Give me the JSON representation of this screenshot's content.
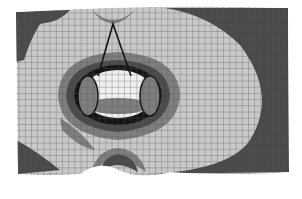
{
  "figure": {
    "type": "fea-mesh-contour",
    "width": 302,
    "height": 199,
    "background": "#ffffff",
    "colors": {
      "dark": "#4a4a4a",
      "mid": "#7e7e7e",
      "light": "#c8c8c8",
      "bright": "#efefef",
      "ring": "#151515",
      "mesh_line": "#555555"
    },
    "mesh": {
      "outline": "M16,12 Q150,4 288,8 L289,172 Q240,176 170,172 Q140,180 118,170 Q100,160 80,174 Q50,176 18,174 Z",
      "cell_size": 6.2
    },
    "regions": [
      {
        "name": "dark-right-region",
        "fill": "dark",
        "d": "M165,8 L288,8 L289,172 L150,174 Q230,170 250,140 Q278,95 240,45 Q210,15 165,8 Z"
      },
      {
        "name": "dark-top-left-patch",
        "fill": "dark",
        "d": "M16,12 L70,10 Q60,22 40,24 Q30,40 24,60 L16,62 Z"
      },
      {
        "name": "dark-bottom-left-patch",
        "fill": "dark",
        "d": "M16,140 Q35,150 60,170 L18,174 Z"
      },
      {
        "name": "mid-top-notch",
        "fill": "mid",
        "d": "M92,10 Q113,30 135,10 Q125,22 113,24 Q100,22 92,10 Z"
      },
      {
        "name": "mid-halo",
        "fill": "mid",
        "d": "M58,95 Q60,55 118,52 Q178,55 180,95 Q178,135 118,140 Q60,135 58,95 Z"
      },
      {
        "name": "dark-halo",
        "fill": "dark",
        "d": "M66,95 Q68,62 118,60 Q168,62 170,95 Q168,128 118,132 Q68,128 66,95 Z"
      },
      {
        "name": "mid-bottom-arch",
        "fill": "mid",
        "d": "M92,172 Q96,150 118,148 Q140,150 146,172 Q130,160 118,160 Q104,160 92,172 Z"
      },
      {
        "name": "dark-bottom-arch",
        "fill": "dark",
        "d": "M100,172 Q104,156 118,154 Q134,156 138,172 Q126,165 118,165 Q108,165 100,172 Z"
      },
      {
        "name": "mid-left-diagonal",
        "fill": "mid",
        "d": "M60,118 Q80,130 95,150 Q80,148 62,130 Z"
      }
    ],
    "central_body": {
      "ring_cx": 118,
      "ring_cy": 95,
      "ring_rx": 44,
      "ring_ry": 30,
      "core_cx": 118,
      "core_cy": 94,
      "core_rx": 36,
      "core_ry": 24,
      "left_lobe": {
        "cx": 88,
        "cy": 96,
        "rx": 10,
        "ry": 20
      },
      "right_lobe": {
        "cx": 150,
        "cy": 96,
        "rx": 10,
        "ry": 20
      }
    },
    "wire": {
      "apex_x": 113,
      "apex_y": 24,
      "left_x": 98,
      "left_y": 76,
      "right_x": 131,
      "right_y": 76
    }
  }
}
